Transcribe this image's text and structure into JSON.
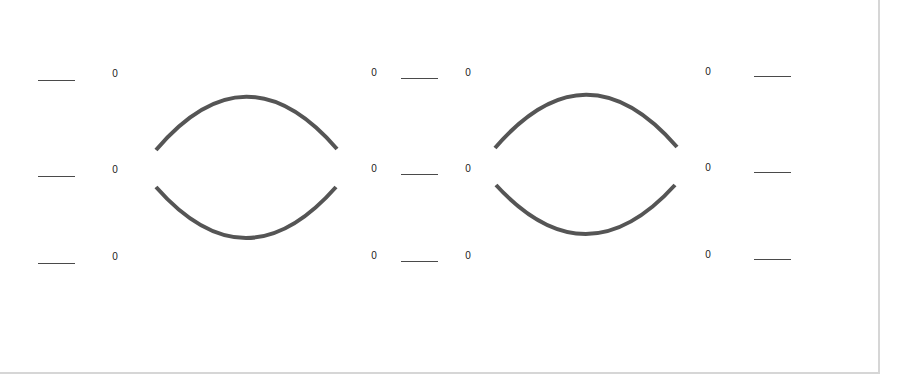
{
  "worksheet": {
    "left_column": {
      "rows": [
        {
          "blank": "",
          "value": "0"
        },
        {
          "blank": "",
          "value": "0"
        },
        {
          "blank": "",
          "value": "0"
        }
      ]
    },
    "middle_column": {
      "rows": [
        {
          "left_value": "0",
          "blank": "",
          "right_value": "0"
        },
        {
          "left_value": "0",
          "blank": "",
          "right_value": "0"
        },
        {
          "left_value": "0",
          "blank": "",
          "right_value": "0"
        }
      ]
    },
    "right_column": {
      "rows": [
        {
          "value": "0",
          "blank": ""
        },
        {
          "value": "0",
          "blank": ""
        },
        {
          "value": "0",
          "blank": ""
        }
      ]
    },
    "shapes": [
      {
        "name": "left-split-ellipse",
        "stroke_color": "#555555"
      },
      {
        "name": "right-split-ellipse",
        "stroke_color": "#555555"
      }
    ]
  }
}
